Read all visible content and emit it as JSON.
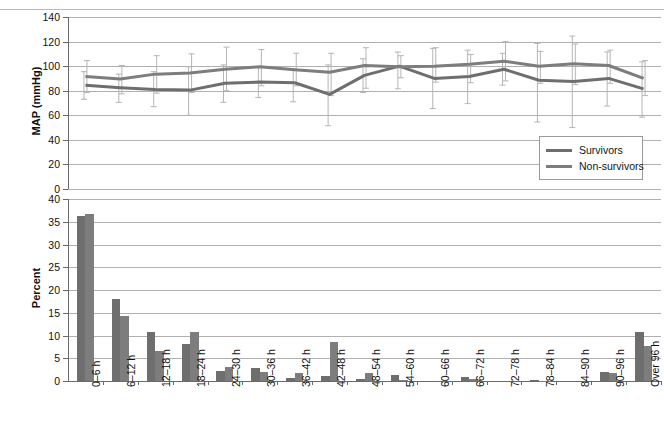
{
  "page": {
    "header_text": "",
    "header_right": ""
  },
  "chart_data": [
    {
      "id": "map-line-chart",
      "type": "line",
      "title": "",
      "xlabel": "",
      "ylabel": "MAP (mmHg)",
      "ylim": [
        0,
        140
      ],
      "yticks": [
        0,
        20,
        40,
        60,
        80,
        100,
        120,
        140
      ],
      "grid": true,
      "legend_position": "bottom-right",
      "categories": [
        "0–6 h",
        "6–12 h",
        "12–18 h",
        "18–24 h",
        "24–30 h",
        "30–36 h",
        "36–42 h",
        "42–48 h",
        "48–54 h",
        "54–60 h",
        "60–66 h",
        "66–72 h",
        "72–78 h",
        "78–84 h",
        "84–90 h",
        "90–96 h",
        "Over 96 h"
      ],
      "series": [
        {
          "name": "Survivors",
          "color": "#6e6e6e",
          "values": [
            84.5,
            82.5,
            81.0,
            80.5,
            86.0,
            87.0,
            86.5,
            77.0,
            92.5,
            100.0,
            90.0,
            91.5,
            97.5,
            88.5,
            87.5,
            90.0,
            81.5
          ],
          "err_low": [
            73.0,
            70.5,
            67.0,
            60.0,
            70.5,
            74.5,
            71.0,
            51.5,
            78.5,
            81.5,
            65.5,
            69.5,
            84.5,
            54.5,
            50.0,
            67.5,
            58.5
          ],
          "err_high": [
            95.5,
            93.5,
            95.5,
            99.5,
            101.0,
            99.5,
            97.5,
            101.0,
            106.0,
            111.5,
            114.5,
            113.0,
            110.5,
            118.5,
            124.5,
            111.5,
            103.5
          ]
        },
        {
          "name": "Non-survivors",
          "color": "#7d7d7d",
          "values": [
            91.5,
            89.5,
            93.5,
            94.5,
            97.5,
            99.5,
            97.0,
            95.0,
            100.5,
            99.5,
            100.0,
            101.5,
            104.0,
            100.0,
            102.0,
            100.5,
            90.0
          ],
          "err_low": [
            78.5,
            77.5,
            78.0,
            78.5,
            80.0,
            84.0,
            84.0,
            76.0,
            82.0,
            90.5,
            87.0,
            86.5,
            88.0,
            86.0,
            85.0,
            86.0,
            76.0
          ],
          "err_high": [
            104.5,
            100.5,
            108.5,
            110.0,
            115.5,
            113.5,
            110.5,
            110.5,
            115.0,
            108.5,
            115.0,
            109.5,
            120.0,
            112.0,
            118.0,
            113.0,
            104.5
          ]
        }
      ]
    },
    {
      "id": "percent-bar-chart",
      "type": "bar",
      "title": "",
      "xlabel": "",
      "ylabel": "Percent",
      "ylim": [
        0,
        40
      ],
      "yticks": [
        0,
        5,
        10,
        15,
        20,
        25,
        30,
        35,
        40
      ],
      "grid": true,
      "categories": [
        "0–6 h",
        "6–12 h",
        "12–18 h",
        "18–24 h",
        "24–30 h",
        "30–36 h",
        "36–42 h",
        "42–48 h",
        "48–54 h",
        "54–60 h",
        "60–66 h",
        "66–72 h",
        "72–78 h",
        "78–84 h",
        "84–90 h",
        "90–96 h",
        "Over 96 h"
      ],
      "series": [
        {
          "name": "Survivors",
          "color": "#6e6e6e",
          "values": [
            36.2,
            18.0,
            10.8,
            8.2,
            2.3,
            2.9,
            0.7,
            1.2,
            0.4,
            1.3,
            0.0,
            0.8,
            0.0,
            0.2,
            0.0,
            2.0,
            10.7
          ]
        },
        {
          "name": "Non-survivors",
          "color": "#7d7d7d",
          "values": [
            36.6,
            14.3,
            6.5,
            10.8,
            3.0,
            1.9,
            1.8,
            8.5,
            1.7,
            0.3,
            0.0,
            0.4,
            0.0,
            0.1,
            0.0,
            1.7,
            7.8
          ]
        }
      ]
    }
  ],
  "legend": {
    "items": [
      {
        "label": "Survivors",
        "color": "#6e6e6e"
      },
      {
        "label": "Non-survivors",
        "color": "#7d7d7d"
      }
    ]
  },
  "colors": {
    "bar_survivors": "#6e6e6e",
    "bar_nonsurvivors": "#7d7d7d",
    "line_survivors": "#6e6e6e",
    "line_nonsurvivors": "#7d7d7d",
    "gridline": "#b0b0b0",
    "axis": "#6a6a6a",
    "errorbar": "#b5b5b5",
    "background": "#ffffff"
  }
}
